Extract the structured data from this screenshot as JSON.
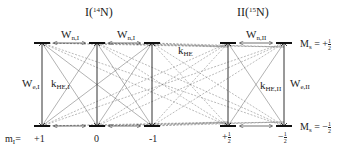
{
  "systems": [
    {
      "name": "I",
      "isotope_mass": "14",
      "element": "N",
      "levels": [
        "+1",
        "0",
        "-1"
      ],
      "labels": {
        "w_n": {
          "main": "W",
          "sub": "n,I"
        },
        "w_e": {
          "main": "W",
          "sub": "e,I"
        },
        "k_he": {
          "main": "k",
          "sub": "HE,I"
        }
      },
      "quantum_number": {
        "main": "m",
        "sub": "I",
        "suffix": "="
      }
    },
    {
      "name": "II",
      "isotope_mass": "15",
      "element": "N",
      "levels": [
        "+½",
        "-½"
      ],
      "labels": {
        "w_n": {
          "main": "W",
          "sub": "n,II"
        },
        "w_e": {
          "main": "W",
          "sub": "e,II"
        },
        "k_he": {
          "main": "k",
          "sub": "HE,II"
        }
      },
      "spin_labels": {
        "upper": {
          "main": "M",
          "sub": "s",
          "sign": "= +",
          "num": "1",
          "den": "2"
        },
        "lower": {
          "main": "M",
          "sub": "s",
          "sign": "= −",
          "num": "1",
          "den": "2"
        }
      }
    }
  ],
  "bottom_fracs": [
    {
      "sign": "+",
      "num": "1",
      "den": "2"
    },
    {
      "sign": "−",
      "num": "1",
      "den": "2"
    }
  ],
  "k_he": {
    "main": "k",
    "sub": "HE"
  },
  "colors": {
    "line": "#333333",
    "dashed": "#777777",
    "thin": "#666666"
  }
}
